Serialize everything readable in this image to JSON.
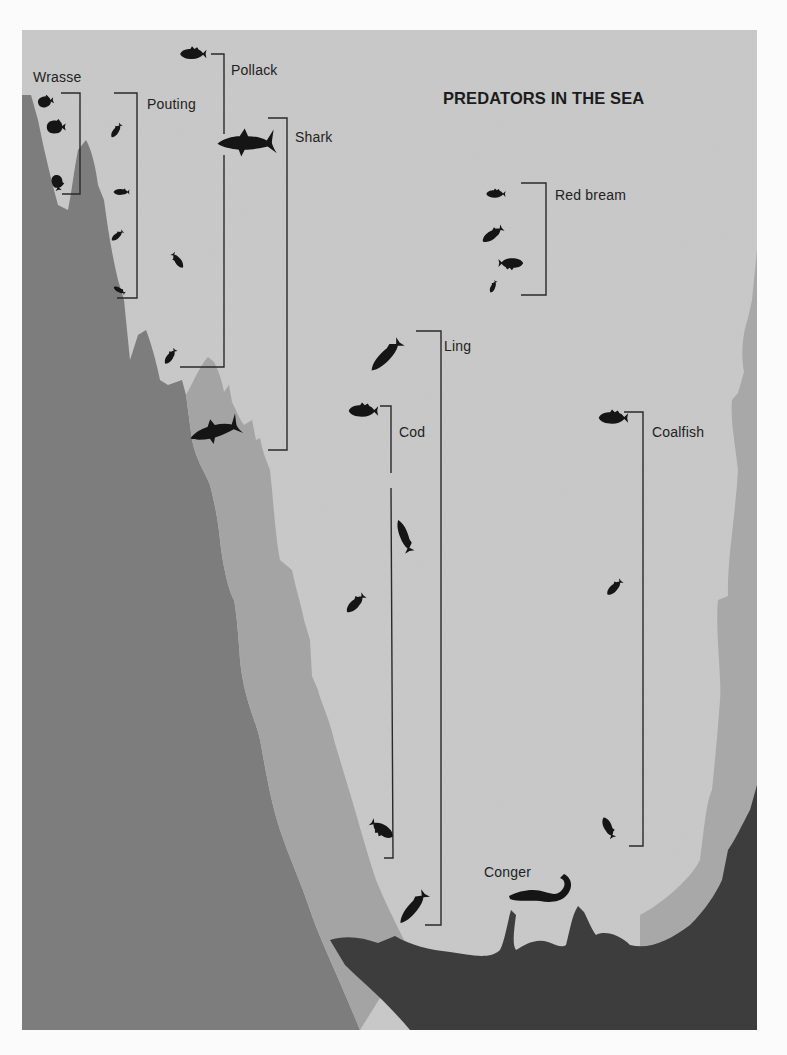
{
  "title": "PREDATORS IN THE SEA",
  "colors": {
    "page_background": "#fbfbfb",
    "open_water": "#c9c9c9",
    "mid_rock": "#a6a6a6",
    "deep_rock": "#7e7e7e",
    "seabed": "#3e3e3e",
    "fish": "#151515",
    "bracket_line": "#2a2a2a"
  },
  "species": [
    {
      "name": "Wrasse",
      "fish_count": 3,
      "label_pos": [
        33,
        77
      ]
    },
    {
      "name": "Pouting",
      "fish_count": 5,
      "label_pos": [
        147,
        104
      ]
    },
    {
      "name": "Pollack",
      "fish_count": 2,
      "label_pos": [
        231,
        70
      ]
    },
    {
      "name": "Shark",
      "fish_count": 2,
      "label_pos": [
        295,
        137
      ]
    },
    {
      "name": "Red bream",
      "fish_count": 4,
      "label_pos": [
        555,
        195
      ]
    },
    {
      "name": "Ling",
      "fish_count": 2,
      "label_pos": [
        444,
        346
      ]
    },
    {
      "name": "Cod",
      "fish_count": 4,
      "label_pos": [
        399,
        432
      ]
    },
    {
      "name": "Coalfish",
      "fish_count": 3,
      "label_pos": [
        652,
        432
      ]
    },
    {
      "name": "Conger",
      "fish_count": 1,
      "label_pos": [
        484,
        872
      ]
    }
  ]
}
